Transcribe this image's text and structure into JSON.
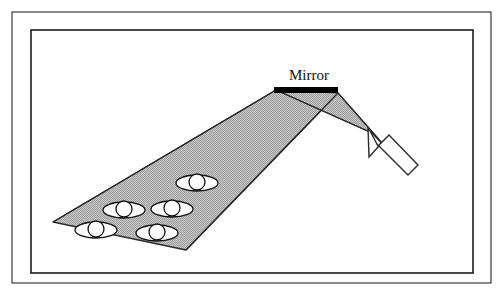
{
  "figure": {
    "type": "optics-ray-diagram",
    "caption_visible": false,
    "background_color": "#ffffff",
    "frames": [
      {
        "name": "outer-frame",
        "x": 12,
        "y": 12,
        "width": 479,
        "height": 271,
        "stroke": "#3a3a3a",
        "stroke_width": 1.2,
        "fill": "none"
      },
      {
        "name": "inner-frame",
        "x": 31,
        "y": 30,
        "width": 442,
        "height": 243,
        "stroke": "#1c1c1c",
        "stroke_width": 1.6,
        "fill": "none"
      }
    ],
    "mirror": {
      "label": "Mirror",
      "label_x": 309,
      "label_y": 80,
      "bar_x": 274,
      "bar_y": 87,
      "bar_width": 64,
      "bar_height": 6,
      "color": "#000000"
    },
    "incident_beam": {
      "name": "incident-beam",
      "description": "narrow shaded wedge from flashlight up-left to mirror",
      "points": "372,133 390,152 338,93 276,90",
      "fill": "#b9b9b9",
      "stroke": "#2b2b2b",
      "stroke_width": 1.1
    },
    "reflected_beam": {
      "name": "reflected-beam",
      "description": "wide shaded wedge from mirror down-left onto the group of eyes",
      "points": "276,90 338,93 186,250 53,222",
      "fill": "#b9b9b9",
      "stroke": "#2b2b2b",
      "stroke_width": 1.3
    },
    "rays": [
      {
        "name": "ray-incident-upper",
        "x1": 372,
        "y1": 133,
        "x2": 276,
        "y2": 90
      },
      {
        "name": "ray-incident-lower",
        "x1": 390,
        "y1": 152,
        "x2": 338,
        "y2": 93
      },
      {
        "name": "ray-reflected-upper",
        "x1": 276,
        "y1": 90,
        "x2": 53,
        "y2": 222
      },
      {
        "name": "ray-reflected-lower",
        "x1": 338,
        "y1": 93,
        "x2": 186,
        "y2": 250
      }
    ],
    "flashlight_arrow": {
      "name": "flashlight-arrow",
      "description": "white block arrow pointing up-left toward the mirror",
      "points": "368,127 378,146 389,135 418,165 408,175 379,146 369,157",
      "fill": "#ffffff",
      "stroke": "#2b2b2b",
      "stroke_width": 1.4
    },
    "eyes": [
      {
        "name": "eye-1",
        "cx": 197,
        "cy": 183,
        "rx": 21,
        "ry": 8,
        "iris_r": 8
      },
      {
        "name": "eye-2",
        "cx": 172,
        "cy": 209,
        "rx": 21,
        "ry": 8,
        "iris_r": 8
      },
      {
        "name": "eye-3",
        "cx": 124,
        "cy": 210,
        "rx": 21,
        "ry": 8,
        "iris_r": 8
      },
      {
        "name": "eye-4",
        "cx": 157,
        "cy": 233,
        "rx": 21,
        "ry": 8,
        "iris_r": 8
      },
      {
        "name": "eye-5",
        "cx": 96,
        "cy": 230,
        "rx": 21,
        "ry": 8,
        "iris_r": 8
      }
    ],
    "eye_style": {
      "fill": "#ffffff",
      "stroke": "#111111",
      "stroke_width": 1.3
    }
  }
}
